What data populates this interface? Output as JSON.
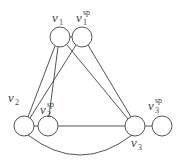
{
  "diagram": {
    "nodes": [
      {
        "id": "v1",
        "base": "v",
        "sub": "1",
        "sup": "",
        "cx": 60,
        "cy": 37
      },
      {
        "id": "v1sp",
        "base": "v",
        "sub": "1",
        "sup": "sp",
        "cx": 82,
        "cy": 37
      },
      {
        "id": "v2",
        "base": "v",
        "sub": "2",
        "sup": "",
        "cx": 24,
        "cy": 126
      },
      {
        "id": "v2sp",
        "base": "v",
        "sub": "2",
        "sup": "sp",
        "cx": 48,
        "cy": 126
      },
      {
        "id": "v3",
        "base": "v",
        "sub": "3",
        "sup": "",
        "cx": 135,
        "cy": 126
      },
      {
        "id": "v3sp",
        "base": "v",
        "sub": "3",
        "sup": "sp",
        "cx": 162,
        "cy": 126
      }
    ],
    "edges": [
      [
        "v1",
        "v1sp"
      ],
      [
        "v1",
        "v2"
      ],
      [
        "v1",
        "v2sp"
      ],
      [
        "v1",
        "v3"
      ],
      [
        "v1sp",
        "v2"
      ],
      [
        "v1sp",
        "v3"
      ],
      [
        "v2",
        "v2sp"
      ],
      [
        "v2sp",
        "v3"
      ],
      [
        "v3",
        "v3sp"
      ],
      [
        "v2",
        "v3"
      ]
    ],
    "labels": {
      "v1": {
        "base": "v",
        "sub": "1",
        "sup": ""
      },
      "v1sp": {
        "base": "v",
        "sub": "1",
        "sup": "sp"
      },
      "v2": {
        "base": "v",
        "sub": "2",
        "sup": ""
      },
      "v2sp": {
        "base": "v",
        "sub": "2",
        "sup": "sp"
      },
      "v3": {
        "base": "v",
        "sub": "3",
        "sup": ""
      },
      "v3sp": {
        "base": "v",
        "sub": "3",
        "sup": "sp"
      }
    }
  }
}
